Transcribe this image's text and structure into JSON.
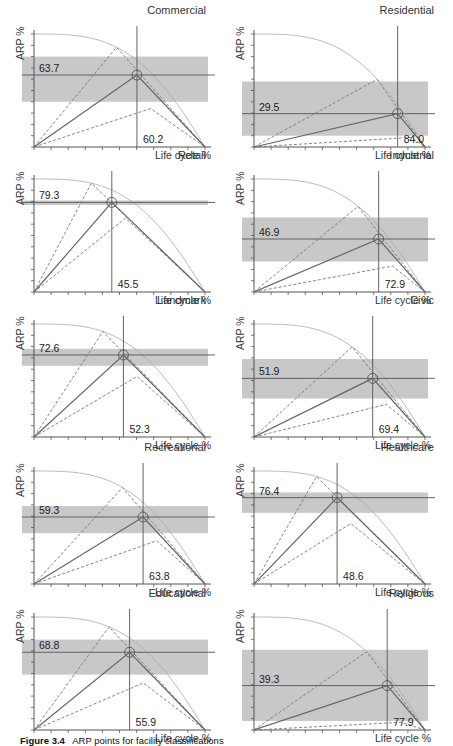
{
  "figure": {
    "caption_label": "Figure 3.4",
    "caption_text": "ARP points for facility classifications"
  },
  "axes": {
    "xlabel": "Life cycle %",
    "ylabel": "ARP %"
  },
  "colors": {
    "band": "#c8c8c8",
    "curve": "#aaaaaa",
    "solid": "#666666",
    "dashed": "#777777",
    "crosshair": "#555555",
    "axis": "#555555"
  },
  "chart_data": [
    {
      "type": "line",
      "title": "Commercial",
      "x_point": 60.2,
      "y_point": 63.7,
      "band": [
        40,
        80
      ],
      "xlabel": "Life cycle %",
      "ylabel": "ARP %",
      "xlim": [
        0,
        100
      ],
      "ylim": [
        0,
        100
      ]
    },
    {
      "type": "line",
      "title": "Residential",
      "x_point": 84.0,
      "y_point": 29.5,
      "band": [
        10,
        58
      ],
      "xlabel": "Life cycle %",
      "ylabel": "ARP %",
      "xlim": [
        0,
        100
      ],
      "ylim": [
        0,
        100
      ]
    },
    {
      "type": "line",
      "title": "Retail",
      "x_point": 45.5,
      "y_point": 79.3,
      "band": [
        77,
        81
      ],
      "xlabel": "Life cycle %",
      "ylabel": "ARP %",
      "xlim": [
        0,
        100
      ],
      "ylim": [
        0,
        100
      ]
    },
    {
      "type": "line",
      "title": "Industrial",
      "x_point": 72.9,
      "y_point": 46.9,
      "band": [
        27,
        66
      ],
      "xlabel": "Life cycle %",
      "ylabel": "ARP %",
      "xlim": [
        0,
        100
      ],
      "ylim": [
        0,
        100
      ]
    },
    {
      "type": "line",
      "title": "Landmark",
      "x_point": 52.3,
      "y_point": 72.6,
      "band": [
        63,
        78
      ],
      "xlabel": "Life cycle %",
      "ylabel": "ARP %",
      "xlim": [
        0,
        100
      ],
      "ylim": [
        0,
        100
      ]
    },
    {
      "type": "line",
      "title": "Civic",
      "x_point": 69.4,
      "y_point": 51.9,
      "band": [
        34,
        69
      ],
      "xlabel": "Life cycle %",
      "ylabel": "ARP %",
      "xlim": [
        0,
        100
      ],
      "ylim": [
        0,
        100
      ]
    },
    {
      "type": "line",
      "title": "Recreational",
      "x_point": 63.8,
      "y_point": 59.3,
      "band": [
        45,
        69
      ],
      "xlabel": "Life cycle %",
      "ylabel": "ARP %",
      "xlim": [
        0,
        100
      ],
      "ylim": [
        0,
        100
      ]
    },
    {
      "type": "line",
      "title": "Healthcare",
      "x_point": 48.6,
      "y_point": 76.4,
      "band": [
        63,
        81
      ],
      "xlabel": "Life cycle %",
      "ylabel": "ARP %",
      "xlim": [
        0,
        100
      ],
      "ylim": [
        0,
        100
      ]
    },
    {
      "type": "line",
      "title": "Educational",
      "x_point": 55.9,
      "y_point": 68.8,
      "band": [
        49,
        80
      ],
      "xlabel": "Life cycle %",
      "ylabel": "ARP %",
      "xlim": [
        0,
        100
      ],
      "ylim": [
        0,
        100
      ]
    },
    {
      "type": "line",
      "title": "Religious",
      "x_point": 77.9,
      "y_point": 39.3,
      "band": [
        8,
        71
      ],
      "xlabel": "Life cycle %",
      "ylabel": "ARP %",
      "xlim": [
        0,
        100
      ],
      "ylim": [
        0,
        100
      ]
    }
  ],
  "panels": [
    {
      "title": "Commercial",
      "y_label": "63.7",
      "x_label": "60.2"
    },
    {
      "title": "Residential",
      "y_label": "29.5",
      "x_label": "84.0"
    },
    {
      "title": "Retail",
      "y_label": "79.3",
      "x_label": "45.5"
    },
    {
      "title": "Industrial",
      "y_label": "46.9",
      "x_label": "72.9"
    },
    {
      "title": "Landmark",
      "y_label": "72.6",
      "x_label": "52.3"
    },
    {
      "title": "Civic",
      "y_label": "51.9",
      "x_label": "69.4"
    },
    {
      "title": "Recreational",
      "y_label": "59.3",
      "x_label": "63.8"
    },
    {
      "title": "Healthcare",
      "y_label": "76.4",
      "x_label": "48.6"
    },
    {
      "title": "Educational",
      "y_label": "68.8",
      "x_label": "55.9"
    },
    {
      "title": "Religious",
      "y_label": "39.3",
      "x_label": "77.9"
    }
  ]
}
